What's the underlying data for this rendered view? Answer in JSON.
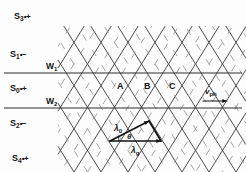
{
  "figure": {
    "width": 246,
    "height": 172,
    "background": "#fdfdfd",
    "line_color": "#3a3a3a",
    "dash_color": "#8a8a8a",
    "text_color": "#111111"
  },
  "levels": [
    {
      "id": "s3",
      "base": "S",
      "index": "3",
      "charge": "•+",
      "x": 14,
      "y": 12
    },
    {
      "id": "s1",
      "base": "S",
      "index": "1",
      "charge": "•−",
      "x": 10,
      "y": 50
    },
    {
      "id": "s0",
      "base": "S",
      "index": "0",
      "charge": "•+",
      "x": 10,
      "y": 84
    },
    {
      "id": "s2",
      "base": "S",
      "index": "2",
      "charge": "•−",
      "x": 10,
      "y": 119
    },
    {
      "id": "s4",
      "base": "S",
      "index": "4",
      "charge": "•+",
      "x": 12,
      "y": 154
    }
  ],
  "wire_lines": [
    {
      "id": "w1",
      "base": "W",
      "index": "1",
      "y": 73,
      "label_x": 46,
      "label_y": 62
    },
    {
      "id": "w2",
      "base": "W",
      "index": "2",
      "y": 108,
      "label_x": 46,
      "label_y": 97
    }
  ],
  "regions": [
    {
      "label": "A",
      "x": 117,
      "y": 82
    },
    {
      "label": "B",
      "x": 144,
      "y": 82
    },
    {
      "label": "C",
      "x": 169,
      "y": 82
    }
  ],
  "velocity": {
    "base": "v",
    "index": "ph",
    "x": 205,
    "y": 88,
    "arrow": {
      "x1": 203,
      "y1": 101,
      "x2": 227,
      "y2": 101
    }
  },
  "vector_triangle": {
    "vertices": [
      {
        "x": 110,
        "y": 141
      },
      {
        "x": 149,
        "y": 121
      },
      {
        "x": 161,
        "y": 141
      }
    ],
    "labels": {
      "lambda0": {
        "base": "λ",
        "index": "0",
        "x": 114,
        "y": 124
      },
      "theta": {
        "text": "θ",
        "x": 127,
        "y": 133
      },
      "lambda_g": {
        "base": "λ",
        "index": "g",
        "x": 131,
        "y": 146
      }
    }
  },
  "geometry": {
    "solid_slope_deg": 58,
    "dash_slope_deg": 58,
    "spacing": 27,
    "note": "cross-hatched lattice of solid lines with interleaved short dashed segments"
  }
}
